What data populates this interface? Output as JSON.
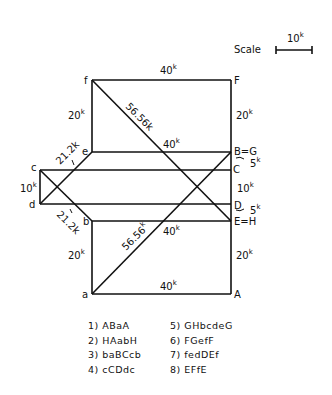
{
  "scale": {
    "label": "Scale",
    "value": "10",
    "unit": "k"
  },
  "nodes": {
    "f": "f",
    "F": "F",
    "e": "e",
    "BG": "B=G",
    "c": "c",
    "C": "C",
    "d": "d",
    "D": "D",
    "b": "b",
    "EH": "E=H",
    "a": "a",
    "A": "A"
  },
  "members": {
    "fF": "40",
    "fe": "20",
    "FBG": "20",
    "fEH": "56.56",
    "eBG": "40",
    "ec": "21.2",
    "cd": "10",
    "db": "21.2",
    "BGC": "5",
    "CD": "10",
    "DEH": "5",
    "bEH": "40",
    "ba": "20",
    "aBG": "56.56",
    "EHA": "20",
    "aA": "40"
  },
  "unit": "k",
  "steps": [
    {
      "label": "1) ABaA"
    },
    {
      "label": "2) HAabH"
    },
    {
      "label": "3) baBCcb"
    },
    {
      "label": "4) cCDdc"
    },
    {
      "label": "5) GHbcdeG"
    },
    {
      "label": "6) FGefF"
    },
    {
      "label": "7) fedDEf"
    },
    {
      "label": "8) EFfE"
    }
  ]
}
